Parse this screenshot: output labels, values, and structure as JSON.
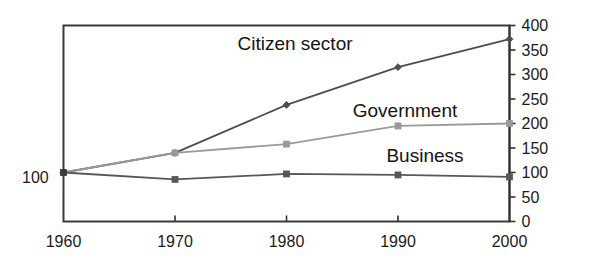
{
  "chart_data": {
    "type": "line",
    "title": "",
    "xlabel": "",
    "ylabel": "",
    "categories": [
      "1960",
      "1970",
      "1980",
      "1990",
      "2000"
    ],
    "x": [
      1960,
      1970,
      1980,
      1990,
      2000
    ],
    "ylim": [
      0,
      400
    ],
    "y_axis_position": "right",
    "y_ticks": [
      "0",
      "50",
      "100",
      "150",
      "200",
      "250",
      "300",
      "350",
      "400"
    ],
    "y_tick_values": [
      0,
      50,
      100,
      150,
      200,
      250,
      300,
      350,
      400
    ],
    "grid": false,
    "legend_position": "inline-labels",
    "baseline_annotation": "100",
    "series": [
      {
        "name": "Citizen sector",
        "values": [
          100,
          140,
          238,
          315,
          372
        ],
        "color": "#4d4d4d",
        "marker": "diamond"
      },
      {
        "name": "Government",
        "values": [
          100,
          140,
          158,
          195,
          200
        ],
        "color": "#9a9a9a",
        "marker": "square"
      },
      {
        "name": "Business",
        "values": [
          100,
          86,
          97,
          95,
          91
        ],
        "color": "#575757",
        "marker": "square"
      }
    ],
    "annotations": [
      {
        "text": "Citizen sector",
        "x": 295,
        "y": 50
      },
      {
        "text": "Government",
        "x": 405,
        "y": 117
      },
      {
        "text": "Business",
        "x": 425,
        "y": 162
      },
      {
        "text": "100",
        "x": 22,
        "y": 183
      }
    ],
    "colors": {
      "axis": "#333333",
      "citizen_sector": "#4d4d4d",
      "government": "#9a9a9a",
      "business": "#575757",
      "background": "#ffffff",
      "text": "#1a1a1a"
    }
  }
}
